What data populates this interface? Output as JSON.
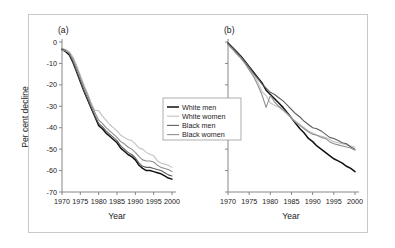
{
  "figure": {
    "panels": [
      {
        "id": "a",
        "label": "(a)"
      },
      {
        "id": "b",
        "label": "(b)"
      }
    ],
    "axis": {
      "ylabel": "Per cent decline",
      "xlabel_a": "Year",
      "xlabel_b": "Year",
      "yticks": [
        "0",
        "-10",
        "-20",
        "-30",
        "-40",
        "-50",
        "-60",
        "-70"
      ],
      "xticks": [
        "1970",
        "1975",
        "1980",
        "1985",
        "1990",
        "1995",
        "2000"
      ]
    },
    "legend": {
      "items": [
        {
          "label": "White men",
          "color": "#111111"
        },
        {
          "label": "White women",
          "color": "#c2c2c2"
        },
        {
          "label": "Black men",
          "color": "#5e5e5e"
        },
        {
          "label": "Black women",
          "color": "#8f8f8f"
        }
      ]
    }
  },
  "chart_data": {
    "type": "line",
    "title": "",
    "xlabel": "Year",
    "ylabel": "Per cent decline",
    "xlim": [
      1970,
      2000
    ],
    "ylim": [
      -70,
      0
    ],
    "grid": false,
    "legend_position": "center",
    "panels": [
      {
        "panel": "a",
        "label": "(a)",
        "x": [
          1970,
          1971,
          1972,
          1973,
          1974,
          1975,
          1976,
          1977,
          1978,
          1979,
          1980,
          1981,
          1982,
          1983,
          1984,
          1985,
          1986,
          1987,
          1988,
          1989,
          1990,
          1991,
          1992,
          1993,
          1994,
          1995,
          1996,
          1997,
          1998,
          1999,
          2000
        ],
        "series": [
          {
            "name": "White men",
            "color": "#111111",
            "values": [
              -3.5,
              -4.5,
              -6.0,
              -9.5,
              -14.0,
              -18.5,
              -23.0,
              -27.0,
              -31.0,
              -35.0,
              -39.0,
              -40.5,
              -42.5,
              -44.0,
              -45.5,
              -47.0,
              -49.5,
              -51.0,
              -52.5,
              -53.5,
              -55.0,
              -57.5,
              -59.0,
              -60.0,
              -60.0,
              -60.5,
              -61.0,
              -61.5,
              -62.5,
              -63.5,
              -64.0
            ]
          },
          {
            "name": "White women",
            "color": "#c2c2c2",
            "values": [
              -3.0,
              -3.5,
              -4.5,
              -7.0,
              -11.0,
              -15.5,
              -20.0,
              -24.0,
              -28.5,
              -32.0,
              -32.0,
              -34.5,
              -36.5,
              -38.5,
              -40.0,
              -41.5,
              -43.5,
              -44.5,
              -45.5,
              -46.0,
              -47.5,
              -49.5,
              -50.0,
              -51.5,
              -52.5,
              -53.0,
              -55.5,
              -56.5,
              -57.0,
              -57.5,
              -58.5
            ]
          },
          {
            "name": "Black men",
            "color": "#5e5e5e",
            "values": [
              -3.2,
              -4.0,
              -5.5,
              -9.0,
              -13.5,
              -18.0,
              -22.5,
              -26.5,
              -30.5,
              -34.5,
              -38.0,
              -39.5,
              -41.5,
              -43.0,
              -44.5,
              -46.0,
              -48.5,
              -50.0,
              -51.5,
              -52.5,
              -54.0,
              -56.5,
              -58.0,
              -58.5,
              -58.5,
              -59.0,
              -59.5,
              -60.0,
              -61.0,
              -62.0,
              -62.5
            ]
          },
          {
            "name": "Black women",
            "color": "#8f8f8f",
            "values": [
              -3.8,
              -4.2,
              -5.0,
              -8.0,
              -12.0,
              -16.5,
              -21.0,
              -25.0,
              -29.5,
              -33.0,
              -36.5,
              -38.0,
              -40.0,
              -41.5,
              -43.0,
              -44.5,
              -46.5,
              -47.5,
              -49.0,
              -50.0,
              -51.5,
              -53.5,
              -55.0,
              -55.5,
              -55.5,
              -56.0,
              -57.5,
              -58.5,
              -59.0,
              -59.5,
              -60.5
            ]
          }
        ]
      },
      {
        "panel": "b",
        "label": "(b)",
        "x": [
          1970,
          1971,
          1972,
          1973,
          1974,
          1975,
          1976,
          1977,
          1978,
          1979,
          1980,
          1981,
          1982,
          1983,
          1984,
          1985,
          1986,
          1987,
          1988,
          1989,
          1990,
          1991,
          1992,
          1993,
          1994,
          1995,
          1996,
          1997,
          1998,
          1999,
          2000
        ],
        "series": [
          {
            "name": "White men",
            "color": "#111111",
            "values": [
              -0.5,
              -2.5,
              -4.5,
              -6.5,
              -9.0,
              -11.5,
              -14.0,
              -16.5,
              -19.0,
              -22.5,
              -24.5,
              -26.5,
              -28.5,
              -30.5,
              -33.0,
              -35.5,
              -38.0,
              -40.5,
              -42.5,
              -45.0,
              -46.5,
              -48.5,
              -50.0,
              -51.5,
              -53.0,
              -54.5,
              -55.5,
              -56.5,
              -58.0,
              -59.0,
              -60.5
            ]
          },
          {
            "name": "White women",
            "color": "#c2c2c2",
            "values": [
              -1.5,
              -3.0,
              -5.0,
              -7.0,
              -9.5,
              -12.0,
              -15.0,
              -18.5,
              -23.0,
              -25.0,
              -28.5,
              -29.5,
              -30.5,
              -32.0,
              -33.5,
              -35.5,
              -37.0,
              -38.5,
              -40.0,
              -41.5,
              -42.5,
              -43.5,
              -44.0,
              -44.5,
              -45.5,
              -46.5,
              -47.0,
              -47.5,
              -48.0,
              -48.5,
              -49.0
            ]
          },
          {
            "name": "Black men",
            "color": "#5e5e5e",
            "values": [
              -0.8,
              -2.8,
              -4.8,
              -7.0,
              -9.5,
              -12.0,
              -14.5,
              -17.0,
              -19.5,
              -21.5,
              -23.5,
              -24.5,
              -26.0,
              -27.5,
              -29.5,
              -31.5,
              -33.5,
              -35.0,
              -37.0,
              -38.5,
              -40.0,
              -40.5,
              -41.5,
              -43.0,
              -44.5,
              -45.0,
              -46.0,
              -47.0,
              -47.5,
              -49.0,
              -50.0
            ]
          },
          {
            "name": "Black women",
            "color": "#8f8f8f",
            "values": [
              -1.2,
              -3.2,
              -5.5,
              -7.5,
              -10.0,
              -13.0,
              -16.0,
              -20.0,
              -24.5,
              -30.5,
              -25.0,
              -28.0,
              -30.0,
              -31.5,
              -33.5,
              -35.5,
              -37.5,
              -39.0,
              -40.5,
              -42.0,
              -43.0,
              -43.5,
              -44.5,
              -45.0,
              -46.5,
              -47.5,
              -48.0,
              -48.5,
              -49.0,
              -49.5,
              -50.5
            ]
          }
        ]
      }
    ]
  }
}
